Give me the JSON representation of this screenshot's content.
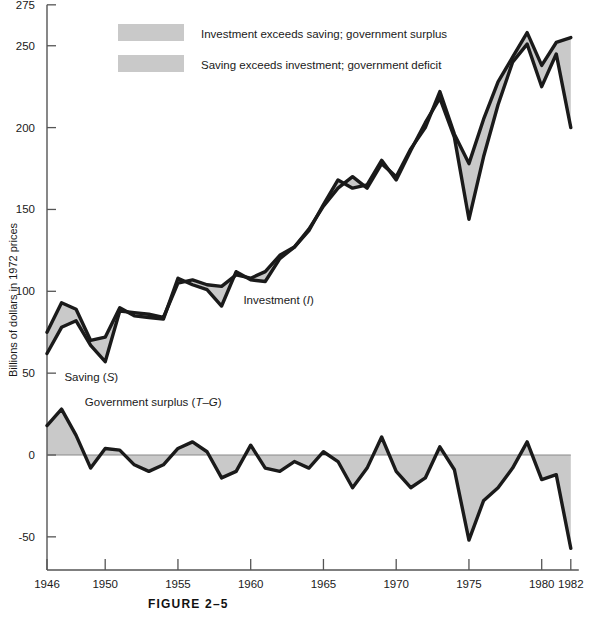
{
  "figure": {
    "caption": "FIGURE 2–5"
  },
  "legend": {
    "position": "top-left-inside",
    "items": [
      {
        "label": "Investment exceeds saving; government surplus",
        "swatch_color": "#c9c9c9"
      },
      {
        "label": "Saving exceeds investment; government deficit",
        "swatch_color": "#c9c9c9"
      }
    ]
  },
  "annotations": [
    {
      "name": "saving-label",
      "text": "Saving (S)",
      "plain": "Saving (",
      "italic": "S",
      "tail": ")",
      "x_year": 1947.2,
      "y_value": 45
    },
    {
      "name": "investment-label",
      "text": "Investment (I)",
      "plain": "Investment (",
      "italic": "I",
      "tail": ")",
      "x_year": 1959.5,
      "y_value": 92
    },
    {
      "name": "government-surplus-label",
      "text": "Government surplus (T–G)",
      "plain": "Government surplus (",
      "italic": "T–G",
      "tail": ")",
      "x_year": 1948.6,
      "y_value": 30
    }
  ],
  "chart_data": {
    "type": "line",
    "title": "",
    "subtitle": "",
    "xlabel": "",
    "ylabel": "Billions of dollars in 1972 prices",
    "xlim": [
      1946,
      1982
    ],
    "ylim": [
      -75,
      275
    ],
    "grid": false,
    "legend_position": "upper-left",
    "y_ticks": [
      275,
      250,
      200,
      150,
      100,
      50,
      0,
      -50
    ],
    "y_tick_labels": [
      "275",
      "250",
      "200",
      "150",
      "100",
      "50",
      "0",
      "-50"
    ],
    "x_ticks": [
      1946,
      1950,
      1955,
      1960,
      1965,
      1970,
      1975,
      1980,
      1982
    ],
    "x_tick_labels": [
      "1946",
      "1950",
      "1955",
      "1960",
      "1965",
      "1970",
      "1975",
      "1980",
      "1982"
    ],
    "x": [
      1946,
      1947,
      1948,
      1949,
      1950,
      1951,
      1952,
      1953,
      1954,
      1955,
      1956,
      1957,
      1958,
      1959,
      1960,
      1961,
      1962,
      1963,
      1964,
      1965,
      1966,
      1967,
      1968,
      1969,
      1970,
      1971,
      1972,
      1973,
      1974,
      1975,
      1976,
      1977,
      1978,
      1979,
      1980,
      1981,
      1982
    ],
    "series": [
      {
        "name": "Saving (S)",
        "symbol": "S",
        "values": [
          62,
          78,
          82,
          67,
          57,
          88,
          87,
          86,
          84,
          105,
          107,
          104,
          103,
          110,
          108,
          112,
          122,
          127,
          138,
          152,
          163,
          170,
          163,
          178,
          170,
          187,
          200,
          222,
          196,
          178,
          205,
          228,
          243,
          258,
          238,
          252,
          255
        ]
      },
      {
        "name": "Investment (I)",
        "symbol": "I",
        "values": [
          75,
          93,
          89,
          70,
          72,
          90,
          85,
          84,
          83,
          108,
          104,
          101,
          91,
          112,
          107,
          106,
          120,
          127,
          137,
          153,
          168,
          163,
          165,
          180,
          168,
          186,
          203,
          218,
          194,
          144,
          182,
          214,
          240,
          251,
          225,
          245,
          200
        ]
      },
      {
        "name": "Government surplus (T-G)",
        "symbol": "T-G",
        "values": [
          18,
          28,
          12,
          -8,
          4,
          3,
          -6,
          -10,
          -6,
          4,
          8,
          2,
          -14,
          -10,
          6,
          -8,
          -10,
          -4,
          -8,
          2,
          -4,
          -20,
          -8,
          11,
          -10,
          -20,
          -14,
          5,
          -9,
          -52,
          -28,
          -20,
          -8,
          8,
          -15,
          -12,
          -57
        ]
      }
    ],
    "fills": {
      "investment_above_saving_color": "#c9c9c9",
      "saving_above_investment_color": "#c9c9c9",
      "surplus_fill_color": "#c9c9c9"
    },
    "line_color": "#1a1a1a"
  }
}
